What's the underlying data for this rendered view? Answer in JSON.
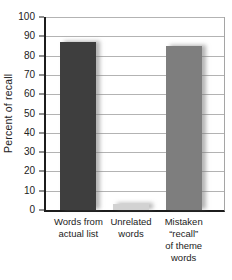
{
  "chart_data": {
    "type": "bar",
    "title": "",
    "ylabel": "Percent of recall",
    "xlabel": "",
    "ylim": [
      0,
      100
    ],
    "yticks": [
      0,
      10,
      20,
      30,
      40,
      50,
      60,
      70,
      80,
      90,
      100
    ],
    "categories": [
      "Words from actual list",
      "Unrelated words",
      "Mistaken “recall” of theme words"
    ],
    "category_lines": [
      "Words from\nactual list",
      "Unrelated\nwords",
      "Mistaken\n“recall”\nof theme\nwords"
    ],
    "values": [
      87,
      3,
      85
    ],
    "bar_colors": [
      "#3e3e3e",
      "#d2d2d2",
      "#7e7e7e"
    ],
    "grid": true,
    "legend": false,
    "gridline_color": "#b3b3b3",
    "axis_color": "#1c1c1c",
    "background_color": "#ffffff"
  }
}
